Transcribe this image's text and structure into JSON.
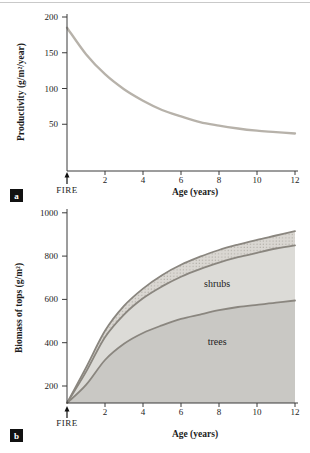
{
  "figure": {
    "top_rule_color": "#c9c9c9",
    "background": "#ffffff"
  },
  "panels": [
    {
      "id": "a",
      "marker_label": "a"
    },
    {
      "id": "b",
      "marker_label": "b"
    }
  ],
  "colors": {
    "axis": "#3b3b3b",
    "text": "#1c1c1c",
    "productivity_curve": "#b7b2aa",
    "biomass_curve": "#8a867f",
    "trees_fill": "#c9c8c4",
    "shrubs_fill": "#dcdbd7",
    "band_fill_bg": "#dad7d2",
    "band_dot": "#a5a19a",
    "marker_bg": "#111111",
    "marker_fg": "#ffffff"
  },
  "chart_data": [
    {
      "type": "line",
      "panel": "a",
      "title": "",
      "xlabel": "Age (years)",
      "ylabel": "Productivity (g/m²/year)",
      "x": [
        0,
        1,
        2,
        3,
        4,
        5,
        6,
        7,
        8,
        9,
        10,
        11,
        12
      ],
      "series": [
        {
          "name": "productivity after fire",
          "values": [
            185,
            148,
            120,
            99,
            83,
            70,
            61,
            53,
            48,
            44,
            41,
            39,
            37
          ]
        }
      ],
      "xticks": [
        2,
        4,
        6,
        8,
        10,
        12
      ],
      "yticks": [
        50,
        100,
        150,
        200
      ],
      "xlim": [
        0,
        12
      ],
      "ylim": [
        0,
        200
      ],
      "grid": false,
      "legend": "none",
      "annotations": [
        {
          "text": "FIRE",
          "x": 0,
          "position": "below-origin-arrow"
        }
      ]
    },
    {
      "type": "area",
      "panel": "b",
      "title": "",
      "xlabel": "Age (years)",
      "ylabel": "Biomass of tops (g/m²)",
      "x": [
        0,
        1,
        2,
        3,
        4,
        5,
        6,
        7,
        8,
        9,
        10,
        11,
        12
      ],
      "series": [
        {
          "name": "trees (upper boundary of trees area)",
          "values": [
            0,
            205,
            320,
            395,
            445,
            480,
            510,
            530,
            550,
            565,
            575,
            585,
            595
          ]
        },
        {
          "name": "shrubs (upper boundary of shrubs area)",
          "values": [
            0,
            265,
            425,
            530,
            605,
            660,
            705,
            740,
            770,
            795,
            815,
            835,
            850
          ]
        },
        {
          "name": "stippled band (upper boundary)",
          "values": [
            0,
            285,
            455,
            570,
            650,
            712,
            760,
            797,
            828,
            853,
            875,
            895,
            915
          ]
        }
      ],
      "xticks": [
        2,
        4,
        6,
        8,
        10,
        12
      ],
      "yticks": [
        200,
        400,
        600,
        800,
        1000
      ],
      "xlim": [
        0,
        12
      ],
      "ylim": [
        0,
        1000
      ],
      "grid": false,
      "legend": "none",
      "area_labels": [
        {
          "text": "shrubs",
          "x": 7.9,
          "y": 655
        },
        {
          "text": "trees",
          "x": 7.9,
          "y": 390
        }
      ],
      "annotations": [
        {
          "text": "FIRE",
          "x": 0,
          "position": "below-origin-arrow"
        }
      ]
    }
  ]
}
